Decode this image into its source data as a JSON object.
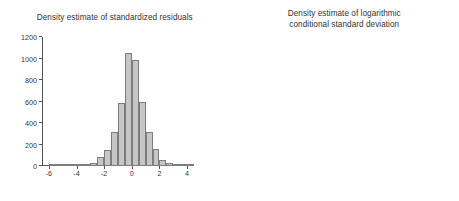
{
  "figure": {
    "background": "#ffffff",
    "bar_fill": "#c6c6c6",
    "bar_stroke": "#7d7d7d",
    "axis_color": "#555555",
    "text_color": "#333333"
  },
  "chart_data": [
    {
      "type": "bar",
      "id": "standardized-residuals",
      "title": "Density estimate of standardized residuals",
      "xlabel": "",
      "ylabel": "",
      "xlim": [
        -6.5,
        4.5
      ],
      "ylim": [
        0,
        1200
      ],
      "grid": false,
      "legend": null,
      "xticks": [
        -6,
        -4,
        -2,
        0,
        2,
        4
      ],
      "xtick_labels": [
        "-6",
        "-4",
        "-2",
        "0",
        "2",
        "4"
      ],
      "yticks": [
        0,
        200,
        400,
        600,
        800,
        1000,
        1200
      ],
      "ytick_labels": [
        "0",
        "200",
        "400",
        "600",
        "800",
        "1000",
        "1200"
      ],
      "bin_width": 0.5,
      "bin_left_edges": [
        -6.0,
        -5.5,
        -5.0,
        -4.5,
        -4.0,
        -3.5,
        -3.0,
        -2.5,
        -2.0,
        -1.5,
        -1.0,
        -0.5,
        0.0,
        0.5,
        1.0,
        1.5,
        2.0,
        2.5,
        3.0,
        3.5,
        4.0
      ],
      "categories": [
        "-6.0",
        "-5.5",
        "-5.0",
        "-4.5",
        "-4.0",
        "-3.5",
        "-3.0",
        "-2.5",
        "-2.0",
        "-1.5",
        "-1.0",
        "-0.5",
        "0.0",
        "0.5",
        "1.0",
        "1.5",
        "2.0",
        "2.5",
        "3.0",
        "3.5",
        "4.0"
      ],
      "values": [
        2,
        2,
        3,
        5,
        8,
        12,
        28,
        80,
        148,
        312,
        588,
        1050,
        990,
        592,
        318,
        160,
        55,
        28,
        12,
        6,
        3
      ]
    },
    {
      "type": "bar",
      "id": "log-conditional-standard-deviation",
      "title": "Density estimate of logarithmic\nconditional standard deviation",
      "xlabel": "",
      "ylabel": "",
      "xlim": [
        -1.15,
        0.22
      ],
      "ylim": [
        0,
        500
      ],
      "grid": false,
      "legend": null,
      "xticks": [
        -1.0,
        -0.8,
        -0.6,
        -0.4,
        -0.2,
        0.0,
        0.2
      ],
      "xtick_labels": [
        "-1.0",
        "-0.8",
        "-0.6",
        "-0.4",
        "-0.2",
        "0.0",
        "0.2"
      ],
      "yticks": [
        0,
        100,
        200,
        300,
        400,
        500
      ],
      "ytick_labels": [
        "0",
        "100",
        "200",
        "300",
        "400",
        "500"
      ],
      "bin_width": 0.05,
      "bin_left_edges": [
        -1.1,
        -1.05,
        -1.0,
        -0.95,
        -0.9,
        -0.85,
        -0.8,
        -0.75,
        -0.7,
        -0.65,
        -0.6,
        -0.55,
        -0.5,
        -0.45,
        -0.4,
        -0.35,
        -0.3,
        -0.25,
        -0.2,
        -0.15,
        -0.1,
        -0.05,
        0.0,
        0.05,
        0.1,
        0.15
      ],
      "categories": [
        "-1.10",
        "-1.05",
        "-1.00",
        "-0.95",
        "-0.90",
        "-0.85",
        "-0.80",
        "-0.75",
        "-0.70",
        "-0.65",
        "-0.60",
        "-0.55",
        "-0.50",
        "-0.45",
        "-0.40",
        "-0.35",
        "-0.30",
        "-0.25",
        "-0.20",
        "-0.15",
        "-0.10",
        "-0.05",
        "0.00",
        "0.05",
        "0.10",
        "0.15"
      ],
      "values": [
        3,
        40,
        120,
        182,
        272,
        402,
        452,
        408,
        412,
        352,
        300,
        260,
        214,
        208,
        148,
        140,
        148,
        110,
        78,
        40,
        42,
        28,
        17,
        15,
        14,
        6
      ]
    }
  ]
}
